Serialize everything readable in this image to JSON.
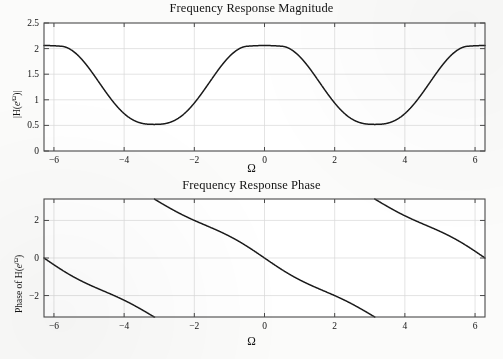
{
  "figure": {
    "width": 503,
    "height": 359,
    "background": "#fbfbfa",
    "curve_color": "#1a1a1a",
    "axis_color": "#4a4a4a",
    "grid_color": "#d9d9d9"
  },
  "charts": [
    {
      "id": "magnitude",
      "type": "line",
      "title": "Frequency Response Magnitude",
      "xlabel": "Ω",
      "ylabel": "|H(e^{jΩ})|",
      "ylabel_parts": {
        "pre": "|H(",
        "ital": "e",
        "sup_j": "j",
        "sup_omega": "Ω",
        "post": ")|"
      },
      "xlim": [
        -6.2832,
        6.2832
      ],
      "ylim": [
        0,
        2.5
      ],
      "xticks": [
        -6,
        -4,
        -2,
        0,
        2,
        4,
        6
      ],
      "xticklabels": [
        "−6",
        "−4",
        "−2",
        "0",
        "2",
        "4",
        "6"
      ],
      "yticks": [
        0,
        0.5,
        1,
        1.5,
        2,
        2.5
      ],
      "yticklabels": [
        "0",
        "0.5",
        "1",
        "1.5",
        "2",
        "2.5"
      ],
      "grid": true,
      "legend": "none",
      "notes": "Periodic raised-cosine-like magnitude; maxima ~2.06 at Ω=0 and Ω=±2π, minima ~0.52 at Ω=±π, flat-topped passband",
      "peak_value": 2.06,
      "trough_value": 0.52,
      "flat_top_half_width": 0.45
    },
    {
      "id": "phase",
      "type": "line",
      "title": "Frequency Response Phase",
      "xlabel": "Ω",
      "ylabel": "Phase of H(e^{jΩ})",
      "ylabel_parts": {
        "pre": "Phase of H(",
        "ital": "e",
        "sup_j": "j",
        "sup_omega": "Ω",
        "post": ")"
      },
      "xlim": [
        -6.2832,
        6.2832
      ],
      "ylim": [
        -3.1416,
        3.1416
      ],
      "xticks": [
        -6,
        -4,
        -2,
        0,
        2,
        4,
        6
      ],
      "xticklabels": [
        "−6",
        "−4",
        "−2",
        "0",
        "2",
        "4",
        "6"
      ],
      "yticks": [
        -2,
        0,
        2
      ],
      "yticklabels": [
        "−2",
        "0",
        "2"
      ],
      "grid": true,
      "legend": "none",
      "notes": "Sawtooth wrapped phase, decreasing with Ω, wrapping at Ω ≈ ±5.10 and ±1.18",
      "wrap_points": [
        -5.1,
        -1.18,
        1.18,
        5.1
      ],
      "value_at_zero": 0,
      "slope_approx": -1.0
    }
  ]
}
